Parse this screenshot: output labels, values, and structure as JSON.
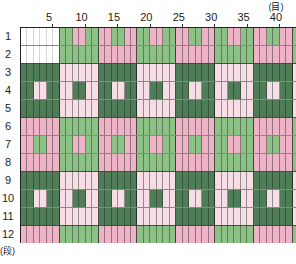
{
  "chart": {
    "column_unit": "(目)",
    "row_unit": "(段)",
    "column_labels": [
      {
        "label": "5",
        "col": 5
      },
      {
        "label": "10",
        "col": 10
      },
      {
        "label": "15",
        "col": 15
      },
      {
        "label": "20",
        "col": 20
      },
      {
        "label": "25",
        "col": 25
      },
      {
        "label": "30",
        "col": 30
      },
      {
        "label": "35",
        "col": 35
      },
      {
        "label": "40",
        "col": 40
      }
    ],
    "row_labels": [
      "1",
      "2",
      "3",
      "4",
      "5",
      "6",
      "7",
      "8",
      "9",
      "10",
      "11",
      "12"
    ],
    "legend_colors": {
      "W": "#ffffff",
      "G": "#8cc285",
      "P": "#eeb3c7",
      "D": "#4e7d57",
      "L": "#f7dde6"
    },
    "grid_columns_visible": 43,
    "grid_rows": [
      "WWWWWWGGPPGGPPGGPPGGPPGGPPGGPPGGPPGGPPGGPPG",
      "WWWWWWGGGGGGPPPPPPGGGGGGPPPPPPGGGGGGPPPPPPG",
      "DDDDDDLLLLLLDDDDDDLLLLLLDDDDDDLLLLLLDDDDDDL",
      "DDLLDDLLDDLLDDLLDDLLDDLLDDLLDDLLDDLLDDLLDDL",
      "DDDDDDLLLLLLDDDDDDLLLLLLDDDDDDLLLLLLDDDDDDL",
      "PPPPPPGGGGGGPPPPPPGGGGGGPPPPPPGGGGGGPPPPPPG",
      "PPGGPPGGPPGGPPGGPPGGPPGGPPGGPPGGPPGGPPGGPPG",
      "PPPPPPGGGGGGPPPPPPGGGGGGPPPPPPGGGGGGPPPPPPG",
      "DDDDDDLLLLLLDDDDDDLLLLLLDDDDDDLLLLLLDDDDDDL",
      "DDLLDDLLDDLLDDLLDDLLDDLLDDLLDDLLDDLLDDLLDDL",
      "DDDDDDLLLLLLDDDDDDLLLLLLDDDDDDLLLLLLDDDDDDL",
      "PPPPPPGGGGGGPPPPPPGGGGGGPPPPPPGGGGGGPPPPPPG"
    ]
  }
}
